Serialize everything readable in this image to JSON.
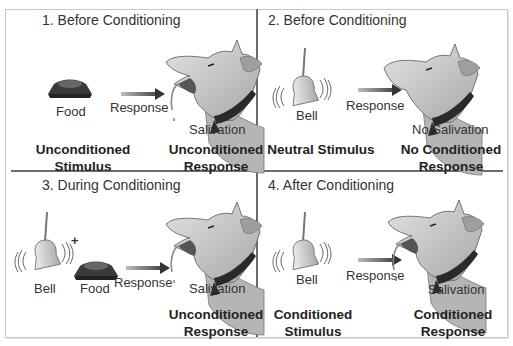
{
  "diagram": {
    "topic": "Classical Conditioning",
    "panels": [
      {
        "title": "1. Before Conditioning",
        "stimulus_items": [
          "Food"
        ],
        "arrow_label": "Response",
        "dog_label": "Salivation",
        "left_caption": [
          "Unconditioned",
          "Stimulus"
        ],
        "right_caption": [
          "Unconditioned",
          "Response"
        ]
      },
      {
        "title": "2. Before Conditioning",
        "stimulus_items": [
          "Bell"
        ],
        "arrow_label": "Response",
        "dog_label": "No Salivation",
        "left_caption": [
          "Neutral Stimulus",
          ""
        ],
        "right_caption": [
          "No Conditioned",
          "Response"
        ]
      },
      {
        "title": "3. During Conditioning",
        "stimulus_items": [
          "Bell",
          "Food"
        ],
        "plus_sign": "+",
        "arrow_label": "Response",
        "dog_label": "Salivation",
        "left_caption": [
          "",
          ""
        ],
        "right_caption": [
          "Unconditioned",
          "Response"
        ]
      },
      {
        "title": "4. After Conditioning",
        "stimulus_items": [
          "Bell"
        ],
        "arrow_label": "Response",
        "dog_label": "Salivation",
        "left_caption": [
          "Conditioned",
          "Stimulus"
        ],
        "right_caption": [
          "Conditioned",
          "Response"
        ]
      }
    ],
    "icons": [
      "food-bowl-icon",
      "bell-icon",
      "dog-head-icon",
      "arrow-right-icon"
    ],
    "colors": {
      "grid_line": "#6b6b6b",
      "frame": "#c8c8c8",
      "dog_fill": "#c9c9c9",
      "collar": "#2a2a2a",
      "bowl": "#3a3a3a",
      "bell": "#cfcfcf"
    }
  }
}
